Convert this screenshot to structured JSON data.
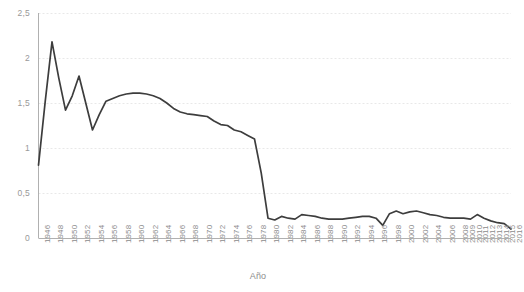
{
  "chart_data": {
    "type": "line",
    "title": "",
    "xlabel": "Año",
    "ylabel": "",
    "grid": true,
    "legend": false,
    "ylim": [
      0,
      2.5
    ],
    "yticks": [
      0,
      0.5,
      1,
      1.5,
      2,
      2.5
    ],
    "ytick_labels": [
      "0",
      "0,5",
      "1",
      "1,5",
      "2",
      "2,5"
    ],
    "xtick_labels": [
      "1946",
      "1948",
      "1950",
      "1952",
      "1954",
      "1956",
      "1958",
      "1960",
      "1962",
      "1964",
      "1966",
      "1968",
      "1970",
      "1972",
      "1974",
      "1976",
      "1978",
      "1980",
      "1982",
      "1984",
      "1986",
      "1988",
      "1990",
      "1992",
      "1994",
      "1996",
      "1998",
      "2000",
      "2002",
      "2004",
      "2006",
      "2008",
      "2009",
      "2010",
      "2011",
      "2012",
      "2013",
      "2014",
      "2015",
      "2016"
    ],
    "line_color": "#3d3d3d",
    "grid_color": "#e8e8e8",
    "axis_color": "#b0b0b0",
    "x": [
      1946,
      1947,
      1948,
      1949,
      1950,
      1951,
      1952,
      1953,
      1954,
      1955,
      1956,
      1957,
      1958,
      1959,
      1960,
      1961,
      1962,
      1963,
      1964,
      1965,
      1966,
      1967,
      1968,
      1969,
      1970,
      1971,
      1972,
      1973,
      1974,
      1975,
      1976,
      1977,
      1978,
      1979,
      1980,
      1981,
      1982,
      1983,
      1984,
      1985,
      1986,
      1987,
      1988,
      1989,
      1990,
      1991,
      1992,
      1993,
      1994,
      1995,
      1996,
      1997,
      1998,
      1999,
      2000,
      2001,
      2002,
      2003,
      2004,
      2005,
      2006,
      2007,
      2008,
      2009,
      2010,
      2011,
      2012,
      2013,
      2014,
      2015,
      2016
    ],
    "values": [
      0.81,
      1.52,
      2.18,
      1.78,
      1.42,
      1.58,
      1.8,
      1.5,
      1.2,
      1.37,
      1.52,
      1.55,
      1.58,
      1.6,
      1.61,
      1.61,
      1.6,
      1.58,
      1.55,
      1.5,
      1.44,
      1.4,
      1.38,
      1.37,
      1.36,
      1.35,
      1.3,
      1.26,
      1.25,
      1.2,
      1.18,
      1.14,
      1.1,
      0.72,
      0.22,
      0.2,
      0.24,
      0.22,
      0.21,
      0.26,
      0.25,
      0.24,
      0.22,
      0.21,
      0.21,
      0.21,
      0.22,
      0.23,
      0.24,
      0.24,
      0.22,
      0.14,
      0.27,
      0.3,
      0.27,
      0.29,
      0.3,
      0.28,
      0.26,
      0.25,
      0.23,
      0.22,
      0.22,
      0.22,
      0.21,
      0.26,
      0.22,
      0.19,
      0.17,
      0.16,
      0.1
    ]
  },
  "axes": {
    "xaxis_title": "Año"
  }
}
